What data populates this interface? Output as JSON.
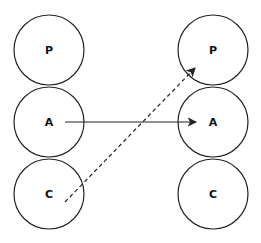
{
  "diagram": {
    "left_column": [
      {
        "label": "P",
        "cx": 49,
        "cy": 50
      },
      {
        "label": "A",
        "cx": 49,
        "cy": 122
      },
      {
        "label": "C",
        "cx": 49,
        "cy": 194
      }
    ],
    "right_column": [
      {
        "label": "P",
        "cx": 213,
        "cy": 50
      },
      {
        "label": "A",
        "cx": 213,
        "cy": 122
      },
      {
        "label": "C",
        "cx": 213,
        "cy": 194
      }
    ],
    "radius": 35,
    "arrows": [
      {
        "style": "solid",
        "from": "left A",
        "to": "right A"
      },
      {
        "style": "dashed",
        "from": "left C",
        "to": "right P"
      }
    ],
    "stroke_color": "#222222"
  }
}
